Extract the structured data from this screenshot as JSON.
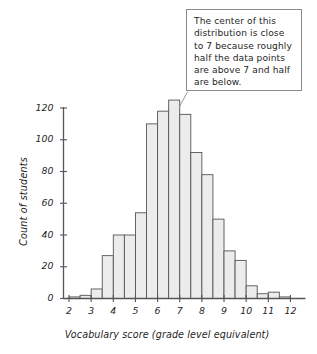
{
  "chart_data": {
    "type": "bar",
    "title": "",
    "subtitle": "",
    "xlabel": "Vocabulary score (grade level equivalent)",
    "ylabel": "Count of students",
    "xlim": [
      1.75,
      12.5
    ],
    "ylim": [
      0,
      128
    ],
    "grid": false,
    "legend": null,
    "xtick_labels": [
      "2",
      "3",
      "4",
      "5",
      "6",
      "7",
      "8",
      "9",
      "10",
      "11",
      "12"
    ],
    "xtick_values": [
      2,
      3,
      4,
      5,
      6,
      7,
      8,
      9,
      10,
      11,
      12
    ],
    "ytick_labels": [
      "0",
      "20",
      "40",
      "60",
      "80",
      "100",
      "120"
    ],
    "ytick_values": [
      0,
      20,
      40,
      60,
      80,
      100,
      120
    ],
    "bin_width": 0.5,
    "bin_starts": [
      2.0,
      2.5,
      3.0,
      3.5,
      4.0,
      4.5,
      5.0,
      5.5,
      6.0,
      6.5,
      7.0,
      7.5,
      8.0,
      8.5,
      9.0,
      9.5,
      10.0,
      10.5,
      11.0,
      11.5
    ],
    "categories": [
      "2.0-2.5",
      "2.5-3.0",
      "3.0-3.5",
      "3.5-4.0",
      "4.0-4.5",
      "4.5-5.0",
      "5.0-5.5",
      "5.5-6.0",
      "6.0-6.5",
      "6.5-7.0",
      "7.0-7.5",
      "7.5-8.0",
      "8.0-8.5",
      "8.5-9.0",
      "9.0-9.5",
      "9.5-10.0",
      "10.0-10.5",
      "10.5-11.0",
      "11.0-11.5",
      "11.5-12.0"
    ],
    "values": [
      1,
      2,
      6,
      27,
      40,
      40,
      54,
      110,
      118,
      125,
      116,
      92,
      78,
      50,
      30,
      24,
      8,
      3,
      4,
      1
    ],
    "bar_fill_color": "#ececec",
    "bar_edge_color": "#555555",
    "axis_color": "#555555",
    "annotations": [
      {
        "name": "center-callout",
        "text": "The center of this distribution is close to 7 because roughly half the data points are above 7 and half are below.",
        "points_to_bin": "6.5-7.0"
      }
    ]
  },
  "callout": {
    "text": "The center of this\ndistribution is close\nto 7 because roughly\nhalf the data points\nare above 7 and half\nare below."
  }
}
